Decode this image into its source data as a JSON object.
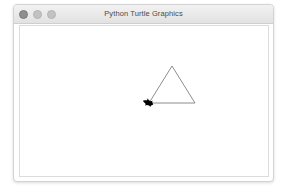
{
  "window": {
    "title": "Python Turtle Graphics",
    "controls": [
      {
        "name": "close",
        "label": "Close",
        "color": "#8e8e8e"
      },
      {
        "name": "minimize",
        "label": "Minimize",
        "color": "#c2c2c2"
      },
      {
        "name": "zoom",
        "label": "Zoom",
        "color": "#c2c2c2"
      }
    ]
  },
  "canvas": {
    "background": "#ffffff",
    "pen_color": "#808080",
    "turtle_color": "#000000",
    "drawing": {
      "shape": "triangle",
      "points": [
        {
          "x": 129,
          "y": 77
        },
        {
          "x": 152,
          "y": 40
        },
        {
          "x": 175,
          "y": 77
        }
      ],
      "turtle": {
        "x": 129,
        "y": 77,
        "heading": 200
      }
    }
  }
}
